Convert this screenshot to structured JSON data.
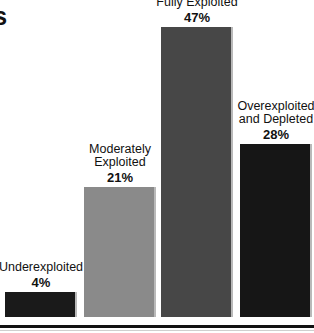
{
  "chart_title_partial": "cks",
  "chart_data": {
    "type": "bar",
    "title": "cks",
    "xlabel": "",
    "ylabel": "",
    "ylim": [
      0,
      50
    ],
    "grid": false,
    "legend": "none",
    "categories": [
      "Underexploited",
      "Moderately Exploited",
      "Fully Exploited",
      "Overexploited and Depleted"
    ],
    "values": [
      4,
      21,
      47,
      28
    ],
    "value_labels": [
      "4%",
      "21%",
      "47%",
      "28%"
    ],
    "bars": [
      {
        "category_line1": "Underexploited",
        "category_line2": "",
        "category_line3": "",
        "value": 4,
        "value_label": "4%",
        "color": "#1a1a1a"
      },
      {
        "category_line1": "Moderately",
        "category_line2": "Exploited",
        "category_line3": "",
        "value": 21,
        "value_label": "21%",
        "color": "#8a8a8a"
      },
      {
        "category_line1": "Fully Exploited",
        "category_line2": "",
        "category_line3": "",
        "value": 47,
        "value_label": "47%",
        "color": "#474747"
      },
      {
        "category_line1": "Overexploited",
        "category_line2": "and Depleted",
        "category_line3": "",
        "value": 28,
        "value_label": "28%",
        "color": "#161616"
      }
    ]
  }
}
